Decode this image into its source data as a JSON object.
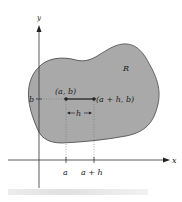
{
  "diagram": {
    "region_label": "R",
    "axis_x_label": "x",
    "axis_y_label": "y",
    "point1_label": "(a, b)",
    "point2_label": "(a + h, b)",
    "h_label": "h",
    "tick_b_label": "b",
    "tick_a_label": "a",
    "tick_ah_label": "a + h",
    "colors": {
      "region_fill": "#a9a9a9",
      "region_stroke": "#444444",
      "axis": "#333333",
      "segment": "#222222",
      "guide": "#666666"
    }
  }
}
